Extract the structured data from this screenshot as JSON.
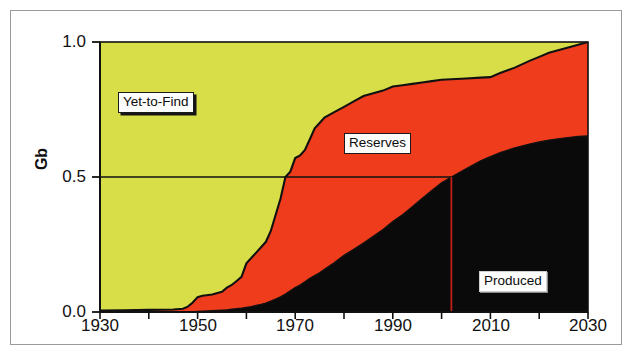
{
  "figure": {
    "background_color": "#ffffff",
    "frame_color": "#9a9a9a"
  },
  "axes": {
    "y_label": "Gb",
    "y_ticks": [
      "0.0",
      "0.5",
      "1.0"
    ],
    "x_ticks": [
      "1930",
      "1950",
      "1970",
      "1990",
      "2010",
      "2030"
    ]
  },
  "labels": {
    "yet_to_find": "Yet-to-Find",
    "reserves": "Reserves",
    "produced": "Produced"
  },
  "colors": {
    "yet_to_find": "#d8de48",
    "reserves": "#ee3c1d",
    "produced": "#0a0a0a",
    "outline": "#111111",
    "marker_line": "#c02018",
    "axis": "#111111"
  },
  "chart_data": {
    "type": "area",
    "title": "",
    "xlabel": "",
    "ylabel": "Gb",
    "xlim": [
      1930,
      2030
    ],
    "ylim": [
      0.0,
      1.0
    ],
    "grid": false,
    "legend_position": "in-plot annotations",
    "stacking": "cumulative fractions of ultimate recoverable resource; top band = Yet-to-Find, middle band = Reserves, bottom band = Produced",
    "x": [
      1930,
      1935,
      1940,
      1945,
      1947,
      1948,
      1949,
      1950,
      1951,
      1953,
      1955,
      1956,
      1957,
      1958,
      1959,
      1960,
      1961,
      1962,
      1963,
      1964,
      1965,
      1966,
      1967,
      1968,
      1969,
      1970,
      1971,
      1972,
      1973,
      1974,
      1975,
      1976,
      1978,
      1980,
      1982,
      1984,
      1986,
      1988,
      1990,
      1992,
      1994,
      1996,
      1998,
      2000,
      2002,
      2005,
      2008,
      2010,
      2012,
      2015,
      2018,
      2020,
      2022,
      2025,
      2028,
      2030
    ],
    "series": [
      {
        "name": "Cumulative Discovered (Produced + Reserves)",
        "note": "boundary between Yet-to-Find (above) and Reserves (below)",
        "values": [
          0.005,
          0.006,
          0.008,
          0.009,
          0.012,
          0.02,
          0.035,
          0.055,
          0.06,
          0.065,
          0.075,
          0.09,
          0.1,
          0.115,
          0.13,
          0.18,
          0.2,
          0.22,
          0.24,
          0.26,
          0.3,
          0.36,
          0.42,
          0.5,
          0.52,
          0.57,
          0.58,
          0.6,
          0.64,
          0.68,
          0.7,
          0.72,
          0.74,
          0.76,
          0.78,
          0.8,
          0.81,
          0.82,
          0.835,
          0.84,
          0.845,
          0.85,
          0.855,
          0.86,
          0.862,
          0.865,
          0.868,
          0.87,
          0.885,
          0.905,
          0.93,
          0.945,
          0.96,
          0.975,
          0.99,
          1.0
        ]
      },
      {
        "name": "Cumulative Produced",
        "note": "boundary between Reserves (above) and Produced (below)",
        "values": [
          0.0,
          0.0,
          0.0,
          0.0,
          0.0,
          0.0,
          0.0,
          0.002,
          0.003,
          0.005,
          0.007,
          0.008,
          0.01,
          0.012,
          0.014,
          0.017,
          0.02,
          0.024,
          0.028,
          0.033,
          0.04,
          0.048,
          0.056,
          0.066,
          0.078,
          0.09,
          0.1,
          0.112,
          0.125,
          0.135,
          0.145,
          0.158,
          0.182,
          0.21,
          0.232,
          0.255,
          0.28,
          0.305,
          0.335,
          0.36,
          0.39,
          0.42,
          0.45,
          0.478,
          0.5,
          0.53,
          0.56,
          0.575,
          0.59,
          0.608,
          0.622,
          0.63,
          0.636,
          0.644,
          0.65,
          0.652
        ]
      }
    ],
    "annotations": [
      {
        "text": "Yet-to-Find",
        "x": 1947,
        "y": 0.78,
        "region": "top band"
      },
      {
        "text": "Reserves",
        "x": 1993,
        "y": 0.6,
        "region": "middle band"
      },
      {
        "text": "Produced",
        "x": 2016,
        "y": 0.18,
        "region": "bottom band"
      },
      {
        "text": "",
        "type": "marker-line",
        "x": 2002,
        "y_from": 0.0,
        "y_to": 0.5,
        "color": "#c02018"
      },
      {
        "text": "",
        "type": "marker-line-horizontal",
        "x_from": 1930,
        "x_to": 2002,
        "y": 0.5,
        "color": "#111111"
      }
    ]
  }
}
